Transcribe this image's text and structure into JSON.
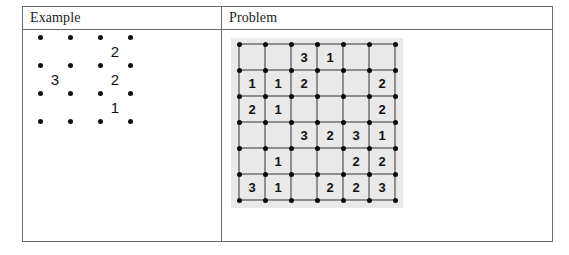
{
  "table": {
    "columns": [
      {
        "id": "example",
        "header": "Example"
      },
      {
        "id": "problem",
        "header": "Problem"
      }
    ]
  },
  "example": {
    "type": "dot-grid-puzzle",
    "dot_rows": 4,
    "dot_cols": 4,
    "cell_rows": 3,
    "cell_cols": 3,
    "dot_spacing_x": 30,
    "dot_spacing_y": 28,
    "clues": [
      {
        "row": 0,
        "col": 2,
        "value": "2"
      },
      {
        "row": 1,
        "col": 0,
        "value": "3"
      },
      {
        "row": 1,
        "col": 2,
        "value": "2"
      },
      {
        "row": 2,
        "col": 2,
        "value": "1"
      }
    ]
  },
  "problem": {
    "type": "dot-grid-puzzle",
    "dot_rows": 7,
    "dot_cols": 7,
    "cell_rows": 6,
    "cell_cols": 6,
    "dot_spacing_x": 26,
    "dot_spacing_y": 26,
    "background_color": "#e9e9e9",
    "line_color": "#8e8e8e",
    "dot_color": "#0b0b0b",
    "cells": [
      [
        "",
        "",
        "3",
        "1",
        "",
        ""
      ],
      [
        "1",
        "1",
        "2",
        "",
        "",
        "2"
      ],
      [
        "2",
        "1",
        "",
        "",
        "",
        "2"
      ],
      [
        "",
        "",
        "3",
        "2",
        "3",
        "1"
      ],
      [
        "",
        "1",
        "",
        "",
        "2",
        "2"
      ],
      [
        "3",
        "1",
        "",
        "2",
        "2",
        "3"
      ]
    ]
  }
}
